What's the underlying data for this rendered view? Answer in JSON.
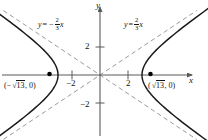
{
  "figure": {
    "kind": "hyperbola-graph",
    "background_color": "#ffffff",
    "curve_color": "#1a1a1a",
    "axis_color": "#5a5a5a",
    "asymptote_color": "#8c8c8c",
    "point_color": "#000000"
  },
  "axes": {
    "x_label": "x",
    "y_label": "y",
    "origin_px": [
      100,
      75
    ],
    "unit_px": 14,
    "x_ticks": [
      {
        "value": -2,
        "label": "−2"
      },
      {
        "value": 2,
        "label": "2"
      }
    ],
    "y_ticks": [
      {
        "value": 2,
        "label": "2"
      },
      {
        "value": -2,
        "label": "−2"
      }
    ]
  },
  "asymptotes": {
    "left": {
      "name": "negative-slope-asymptote",
      "equation_text": "y = −2/3 x",
      "y_var": "y",
      "equals": "=",
      "sign": "−",
      "numerator": "2",
      "denominator": "3",
      "x_var": "x",
      "slope": -0.6667
    },
    "right": {
      "name": "positive-slope-asymptote",
      "equation_text": "y = 2/3 x",
      "y_var": "y",
      "equals": "=",
      "sign": "",
      "numerator": "2",
      "denominator": "3",
      "x_var": "x",
      "slope": 0.6667
    }
  },
  "points": [
    {
      "name": "left-focus",
      "label_text": "(−√13, 0)",
      "open_paren": "(",
      "sign": "−",
      "radical_sign": "√",
      "radicand": "13",
      "comma_zero": ", 0)",
      "x_value": -3.6056,
      "y_value": 0,
      "px": [
        49,
        75
      ]
    },
    {
      "name": "right-focus",
      "label_text": "(√13, 0)",
      "open_paren": "(",
      "sign": "",
      "radical_sign": "√",
      "radicand": "13",
      "comma_zero": ", 0)",
      "x_value": 3.6056,
      "y_value": 0,
      "px": [
        151,
        75
      ]
    }
  ],
  "chart_data": {
    "type": "line",
    "title": "",
    "xlabel": "x",
    "ylabel": "y",
    "xlim": [
      -7.1,
      7.7
    ],
    "ylim": [
      -4.6,
      5.4
    ],
    "grid": false,
    "legend": "none",
    "equation": "x^2/9 - y^2/4 = 1",
    "a": 3,
    "b": 2,
    "c": 3.6056,
    "vertices": [
      [
        -3,
        0
      ],
      [
        3,
        0
      ]
    ],
    "foci": [
      [
        -3.6056,
        0
      ],
      [
        3.6056,
        0
      ]
    ],
    "series": [
      {
        "name": "left-branch",
        "style": "solid",
        "x": [
          -3,
          -3.1,
          -3.3,
          -3.6,
          -4.0,
          -4.5,
          -5.0,
          -5.6,
          -6.2,
          -6.8
        ],
        "y_upper": [
          0,
          0.51,
          0.92,
          1.34,
          1.76,
          2.23,
          2.67,
          3.16,
          3.64,
          4.09
        ],
        "y_lower": [
          0,
          -0.51,
          -0.92,
          -1.34,
          -1.76,
          -2.23,
          -2.67,
          -3.16,
          -3.64,
          -4.09
        ]
      },
      {
        "name": "right-branch",
        "style": "solid",
        "x": [
          3,
          3.1,
          3.3,
          3.6,
          4.0,
          4.5,
          5.0,
          5.6,
          6.2,
          6.8
        ],
        "y_upper": [
          0,
          0.51,
          0.92,
          1.34,
          1.76,
          2.23,
          2.67,
          3.16,
          3.64,
          4.09
        ],
        "y_lower": [
          0,
          -0.51,
          -0.92,
          -1.34,
          -1.76,
          -2.23,
          -2.67,
          -3.16,
          -3.64,
          -4.09
        ]
      },
      {
        "name": "asymptote-positive",
        "style": "dashed",
        "x": [
          -6.9,
          6.9
        ],
        "y": [
          -4.6,
          4.6
        ]
      },
      {
        "name": "asymptote-negative",
        "style": "dashed",
        "x": [
          -6.9,
          6.9
        ],
        "y": [
          4.6,
          -4.6
        ]
      }
    ],
    "annotations": [
      {
        "text": "y = -2/3 x",
        "x": -4.3,
        "y": 4.0
      },
      {
        "text": "y = 2/3 x",
        "x": 2.0,
        "y": 4.0
      },
      {
        "text": "(-sqrt(13), 0)",
        "x": -5.2,
        "y": -0.7
      },
      {
        "text": "(sqrt(13), 0)",
        "x": 3.6,
        "y": -0.7
      }
    ]
  }
}
